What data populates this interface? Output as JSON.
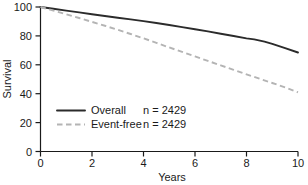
{
  "chart_data": {
    "type": "line",
    "title": "",
    "xlabel": "Years",
    "ylabel": "Survival",
    "xlim": [
      0,
      10
    ],
    "ylim": [
      0,
      100
    ],
    "xticks": [
      0,
      2,
      4,
      6,
      8,
      10
    ],
    "yticks": [
      0,
      20,
      40,
      60,
      80,
      100
    ],
    "xtick_labels": [
      "0",
      "2",
      "4",
      "6",
      "8",
      "10"
    ],
    "ytick_labels": [
      "0",
      "20",
      "40",
      "60",
      "80",
      "100"
    ],
    "grid": false,
    "legend_position": "center-left",
    "series": [
      {
        "name": "Overall",
        "n_label": "n = 2429",
        "n": 2429,
        "style": "solid",
        "color": "#2b2b2b",
        "x": [
          0,
          0.5,
          1,
          1.5,
          2,
          2.5,
          3,
          3.5,
          4,
          4.5,
          5,
          5.5,
          6,
          6.5,
          7,
          7.5,
          8,
          8.3,
          8.7,
          9,
          9.5,
          10
        ],
        "y": [
          100,
          98.8,
          97.5,
          96.3,
          95.0,
          93.8,
          92.6,
          91.4,
          90.2,
          88.9,
          87.5,
          86.1,
          84.6,
          83.1,
          81.5,
          79.9,
          78.3,
          77.6,
          76.0,
          74.5,
          71.5,
          68.5
        ]
      },
      {
        "name": "Event-free",
        "n_label": "n = 2429",
        "n": 2429,
        "style": "dashed",
        "color": "#b4b4b4",
        "x": [
          0,
          0.5,
          1,
          1.5,
          2,
          2.5,
          3,
          3.5,
          4,
          4.5,
          5,
          5.5,
          6,
          6.5,
          7,
          7.5,
          8,
          8.5,
          9,
          9.5,
          10
        ],
        "y": [
          100,
          97.5,
          95.0,
          92.4,
          89.7,
          87.0,
          84.2,
          81.3,
          78.3,
          75.2,
          72.0,
          68.9,
          65.8,
          62.7,
          59.6,
          56.5,
          53.4,
          50.4,
          47.4,
          44.4,
          41.0
        ]
      }
    ],
    "legend": [
      {
        "label": "Overall",
        "value": "n = 2429",
        "style": "solid"
      },
      {
        "label": "Event-free",
        "value": "n = 2429",
        "style": "dashed"
      }
    ]
  },
  "colors": {
    "axis": "#1a1a1a",
    "overall": "#2b2b2b",
    "event_free": "#b4b4b4",
    "background": "#ffffff"
  }
}
